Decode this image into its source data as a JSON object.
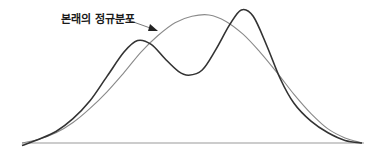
{
  "diagram": {
    "annotation": {
      "text": "본래의 정규분포"
    },
    "curves": [
      {
        "name": "original-normal-distribution",
        "color": "#8a8a8a",
        "points": [
          [
            0,
            0.0
          ],
          [
            0.05,
            0.03
          ],
          [
            0.1,
            0.08
          ],
          [
            0.15,
            0.16
          ],
          [
            0.2,
            0.27
          ],
          [
            0.25,
            0.4
          ],
          [
            0.3,
            0.55
          ],
          [
            0.35,
            0.71
          ],
          [
            0.4,
            0.84
          ],
          [
            0.45,
            0.94
          ],
          [
            0.5,
            0.99
          ],
          [
            0.55,
            1.0
          ],
          [
            0.6,
            0.95
          ],
          [
            0.65,
            0.85
          ],
          [
            0.7,
            0.71
          ],
          [
            0.75,
            0.55
          ],
          [
            0.8,
            0.38
          ],
          [
            0.85,
            0.23
          ],
          [
            0.9,
            0.11
          ],
          [
            0.95,
            0.04
          ],
          [
            1.0,
            0.0
          ]
        ]
      },
      {
        "name": "bimodal-distribution",
        "color": "#333333",
        "points": [
          [
            0,
            -0.02
          ],
          [
            0.05,
            0.03
          ],
          [
            0.1,
            0.09
          ],
          [
            0.15,
            0.19
          ],
          [
            0.2,
            0.33
          ],
          [
            0.25,
            0.52
          ],
          [
            0.3,
            0.71
          ],
          [
            0.34,
            0.8
          ],
          [
            0.38,
            0.77
          ],
          [
            0.42,
            0.66
          ],
          [
            0.46,
            0.56
          ],
          [
            0.49,
            0.53
          ],
          [
            0.53,
            0.57
          ],
          [
            0.57,
            0.73
          ],
          [
            0.61,
            0.92
          ],
          [
            0.645,
            1.04
          ],
          [
            0.68,
            0.99
          ],
          [
            0.72,
            0.76
          ],
          [
            0.76,
            0.5
          ],
          [
            0.8,
            0.31
          ],
          [
            0.85,
            0.17
          ],
          [
            0.9,
            0.08
          ],
          [
            0.95,
            0.02
          ],
          [
            1.0,
            0.0
          ]
        ]
      }
    ],
    "colors": {
      "baseline": "#9a9a9a",
      "arrow": "#222222"
    }
  }
}
